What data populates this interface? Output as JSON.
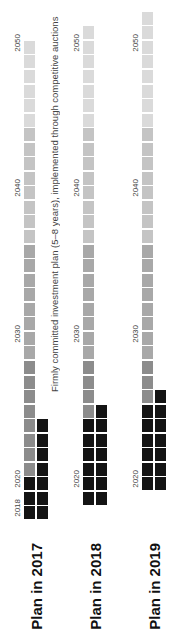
{
  "chart_data": {
    "type": "heatmap",
    "title": "",
    "annotation": "Firmly committed investment plan (5–8 years), implemented through competitive auctions",
    "orientation": "rotated-90",
    "year_tick_labels": [
      "2018",
      "2020",
      "2030",
      "2040",
      "2050"
    ],
    "plans": [
      {
        "label": "Plan in 2017",
        "start_year": 2018,
        "end_year": 2050,
        "committed_main_years": 3,
        "committed_bar_years": 7
      },
      {
        "label": "Plan in 2018",
        "start_year": 2019,
        "end_year": 2051,
        "committed_main_years": 6,
        "committed_bar_years": 7
      },
      {
        "label": "Plan in 2019",
        "start_year": 2020,
        "end_year": 2052,
        "committed_main_years": 6,
        "committed_bar_years": 7
      }
    ],
    "colors": {
      "committed": "#141414",
      "near_term": "#8c8c8c",
      "mid_term": "#a8a8a8",
      "long_term": "#c4c4c4",
      "far_term": "#dadada"
    }
  },
  "labels": {
    "plan_2017": "Plan in 2017",
    "plan_2018": "Plan in 2018",
    "plan_2019": "Plan in 2019",
    "annotation": "Firmly committed investment plan (5–8 years), implemented through competitive auctions",
    "y2018": "2018",
    "y2020": "2020",
    "y2030": "2030",
    "y2040": "2040",
    "y2050": "2050"
  }
}
